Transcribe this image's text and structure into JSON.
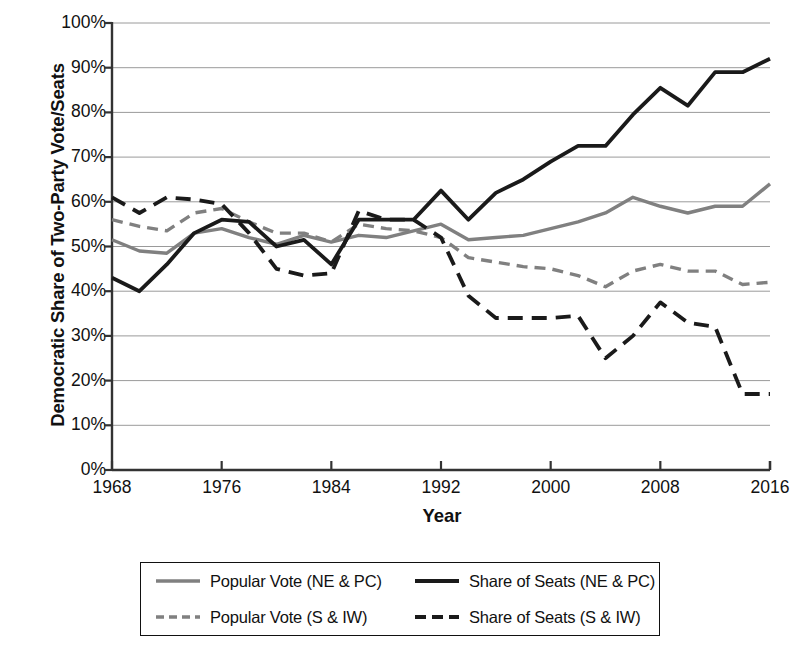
{
  "chart_data": {
    "type": "line",
    "title": "",
    "xlabel": "Year",
    "ylabel": "Democratic Share of Two-Party Vote/Seats",
    "xlim": [
      1968,
      2016
    ],
    "ylim": [
      0,
      100
    ],
    "grid": true,
    "legend_position": "bottom",
    "x_ticks": [
      "1968",
      "1976",
      "1984",
      "1992",
      "2000",
      "2008",
      "2016"
    ],
    "x_tick_values": [
      1968,
      1976,
      1984,
      1992,
      2000,
      2008,
      2016
    ],
    "y_ticks": [
      "0%",
      "10%",
      "20%",
      "30%",
      "40%",
      "50%",
      "60%",
      "70%",
      "80%",
      "90%",
      "100%"
    ],
    "y_tick_values": [
      0,
      10,
      20,
      30,
      40,
      50,
      60,
      70,
      80,
      90,
      100
    ],
    "x": [
      1968,
      1970,
      1972,
      1974,
      1976,
      1978,
      1980,
      1982,
      1984,
      1986,
      1988,
      1990,
      1992,
      1994,
      1996,
      1998,
      2000,
      2002,
      2004,
      2006,
      2008,
      2010,
      2012,
      2014,
      2016
    ],
    "series": [
      {
        "name": "Popular Vote (NE & PC)",
        "color": "#808080",
        "style": "solid",
        "values": [
          51.5,
          49.0,
          48.5,
          53.0,
          54.0,
          52.0,
          50.5,
          52.5,
          51.0,
          52.5,
          52.0,
          53.5,
          55.0,
          51.5,
          52.0,
          52.5,
          54.0,
          55.5,
          57.5,
          61.0,
          59.0,
          57.5,
          59.0,
          59.0,
          64.0
        ]
      },
      {
        "name": "Popular Vote (S & IW)",
        "color": "#808080",
        "style": "dashed",
        "values": [
          56.0,
          54.5,
          53.5,
          57.5,
          58.5,
          55.5,
          53.0,
          53.0,
          51.0,
          55.0,
          54.0,
          53.5,
          52.0,
          47.5,
          46.5,
          45.5,
          45.0,
          43.5,
          41.0,
          44.5,
          46.0,
          44.5,
          44.5,
          41.5,
          42.0
        ]
      },
      {
        "name": "Share of Seats (NE & PC)",
        "color": "#1a1a1a",
        "style": "solid",
        "values": [
          43.0,
          40.0,
          46.0,
          53.0,
          56.0,
          55.5,
          50.0,
          51.5,
          46.0,
          56.0,
          56.0,
          56.0,
          62.5,
          56.0,
          62.0,
          65.0,
          69.0,
          72.5,
          72.5,
          79.5,
          85.5,
          81.5,
          89.0,
          89.0,
          92.0
        ]
      },
      {
        "name": "Share of Seats (S & IW)",
        "color": "#1a1a1a",
        "style": "dashed",
        "values": [
          61.0,
          57.5,
          61.0,
          60.5,
          59.5,
          53.0,
          45.0,
          43.5,
          44.0,
          58.0,
          56.0,
          56.0,
          52.0,
          39.0,
          34.0,
          34.0,
          34.0,
          34.5,
          25.0,
          30.0,
          37.5,
          33.0,
          32.0,
          17.0,
          17.0
        ]
      }
    ]
  },
  "legend": {
    "entries": [
      {
        "label": "Popular Vote (NE & PC)",
        "color": "#808080",
        "style": "solid"
      },
      {
        "label": "Share of Seats (NE & PC)",
        "color": "#1a1a1a",
        "style": "solid"
      },
      {
        "label": "Popular Vote (S & IW)",
        "color": "#808080",
        "style": "dashed"
      },
      {
        "label": "Share of Seats (S & IW)",
        "color": "#1a1a1a",
        "style": "dashed"
      }
    ]
  }
}
